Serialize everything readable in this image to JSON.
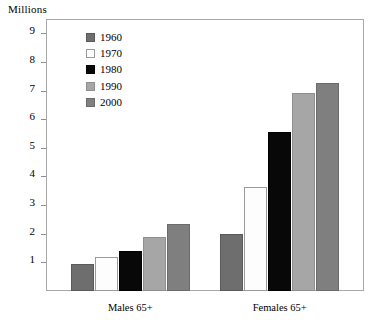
{
  "chart_data": {
    "type": "bar",
    "title": "Millions",
    "xlabel": "",
    "ylabel": "Millions",
    "ylim": [
      0,
      9.5
    ],
    "ytick_labels": [
      "9",
      "8",
      "7",
      "6",
      "5",
      "4",
      "3",
      "2",
      "1"
    ],
    "yticks": [
      9,
      8,
      7,
      6,
      5,
      4,
      3,
      2,
      1
    ],
    "grid": false,
    "legend_position": "inside-upper-left",
    "categories": [
      "Males 65+",
      "Females 65+"
    ],
    "series": [
      {
        "name": "1960",
        "color": "#6e6e6e",
        "border": "#5a5a5a",
        "values": [
          0.95,
          2.0
        ]
      },
      {
        "name": "1970",
        "color": "#fdfdfd",
        "border": "#9a9a9a",
        "values": [
          1.2,
          3.65
        ]
      },
      {
        "name": "1980",
        "color": "#080808",
        "border": "#000000",
        "values": [
          1.4,
          5.55
        ]
      },
      {
        "name": "1990",
        "color": "#a6a6a6",
        "border": "#8f8f8f",
        "values": [
          1.9,
          6.9
        ]
      },
      {
        "name": "2000",
        "color": "#7f7f7f",
        "border": "#6b6b6b",
        "values": [
          2.35,
          7.25
        ]
      }
    ]
  }
}
